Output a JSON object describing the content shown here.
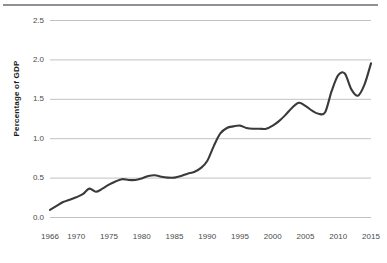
{
  "chart_data": {
    "type": "line",
    "title": "",
    "xlabel": "",
    "ylabel": "Percentage of GDP",
    "xlim": [
      1966,
      2015
    ],
    "ylim": [
      0.0,
      2.5
    ],
    "grid": true,
    "legend": "none",
    "series_color": "#3a3a3a",
    "grid_color": "#bfc2c6",
    "y_ticks": [
      "0.0",
      "0.5",
      "1.0",
      "1.5",
      "2.0",
      "2.5"
    ],
    "y_tick_values": [
      0.0,
      0.5,
      1.0,
      1.5,
      2.0,
      2.5
    ],
    "x_ticks": [
      "1966",
      "1970",
      "1975",
      "1980",
      "1985",
      "1990",
      "1995",
      "2000",
      "2005",
      "2010",
      "2015"
    ],
    "x_tick_values": [
      1966,
      1970,
      1975,
      1980,
      1985,
      1990,
      1995,
      2000,
      2005,
      2010,
      2015
    ],
    "x": [
      1966,
      1967,
      1968,
      1969,
      1970,
      1971,
      1972,
      1973,
      1974,
      1975,
      1976,
      1977,
      1978,
      1979,
      1980,
      1981,
      1982,
      1983,
      1984,
      1985,
      1986,
      1987,
      1988,
      1989,
      1990,
      1991,
      1992,
      1993,
      1994,
      1995,
      1996,
      1997,
      1998,
      1999,
      2000,
      2001,
      2002,
      2003,
      2004,
      2005,
      2006,
      2007,
      2008,
      2009,
      2010,
      2011,
      2012,
      2013,
      2014,
      2015
    ],
    "values": [
      0.09,
      0.14,
      0.19,
      0.22,
      0.25,
      0.29,
      0.36,
      0.32,
      0.36,
      0.41,
      0.45,
      0.48,
      0.47,
      0.47,
      0.49,
      0.52,
      0.53,
      0.51,
      0.5,
      0.5,
      0.52,
      0.55,
      0.57,
      0.62,
      0.71,
      0.9,
      1.06,
      1.13,
      1.15,
      1.16,
      1.13,
      1.12,
      1.12,
      1.12,
      1.16,
      1.22,
      1.3,
      1.39,
      1.45,
      1.41,
      1.35,
      1.31,
      1.33,
      1.6,
      1.8,
      1.82,
      1.62,
      1.54,
      1.68,
      1.95
    ],
    "series": [
      {
        "name": "Percentage of GDP",
        "values": [
          0.09,
          0.14,
          0.19,
          0.22,
          0.25,
          0.29,
          0.36,
          0.32,
          0.36,
          0.41,
          0.45,
          0.48,
          0.47,
          0.47,
          0.49,
          0.52,
          0.53,
          0.51,
          0.5,
          0.5,
          0.52,
          0.55,
          0.57,
          0.62,
          0.71,
          0.9,
          1.06,
          1.13,
          1.15,
          1.16,
          1.13,
          1.12,
          1.12,
          1.12,
          1.16,
          1.22,
          1.3,
          1.39,
          1.45,
          1.41,
          1.35,
          1.31,
          1.33,
          1.6,
          1.8,
          1.82,
          1.62,
          1.54,
          1.68,
          1.95
        ]
      }
    ]
  },
  "axis": {
    "y_title": "Percentage of GDP"
  }
}
